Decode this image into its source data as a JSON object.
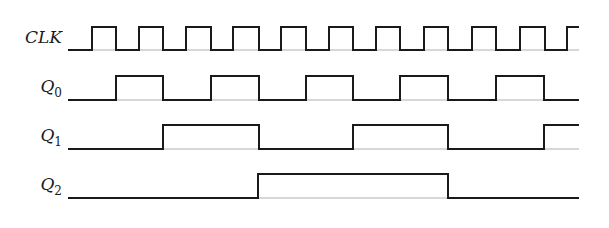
{
  "diagram": {
    "type": "timing-diagram",
    "stroke_color": "#1a1a1a",
    "signals": [
      {
        "name": "CLK",
        "label": "CLK",
        "subscript": "",
        "high_y": 27,
        "low_y": 50,
        "label_y": 38,
        "start_x": 68,
        "end_x": 579,
        "initial": "low",
        "edges": [
          92,
          116,
          139,
          163,
          186,
          211,
          233,
          259,
          281,
          306,
          329,
          353,
          376,
          400,
          424,
          448,
          472,
          496,
          520,
          545,
          567
        ]
      },
      {
        "name": "Q0",
        "label": "Q",
        "subscript": "0",
        "high_y": 76,
        "low_y": 100,
        "label_y": 88,
        "start_x": 68,
        "end_x": 579,
        "initial": "low",
        "edges": [
          116,
          163,
          211,
          259,
          306,
          353,
          400,
          448,
          496,
          544
        ]
      },
      {
        "name": "Q1",
        "label": "Q",
        "subscript": "1",
        "high_y": 125,
        "low_y": 149,
        "label_y": 137,
        "start_x": 68,
        "end_x": 579,
        "initial": "low",
        "edges": [
          163,
          259,
          353,
          448,
          544
        ]
      },
      {
        "name": "Q2",
        "label": "Q",
        "subscript": "2",
        "high_y": 174,
        "low_y": 198,
        "label_y": 186,
        "start_x": 68,
        "end_x": 579,
        "initial": "low",
        "edges": [
          258,
          448
        ]
      }
    ]
  }
}
